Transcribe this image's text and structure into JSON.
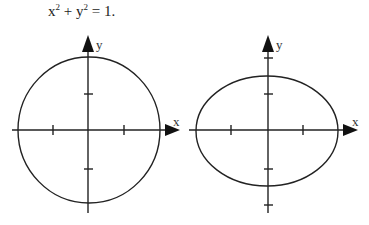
{
  "equation": {
    "var1": "x",
    "exp1": "2",
    "op": " + ",
    "var2": "y",
    "exp2": "2",
    "rhs": " = 1."
  },
  "figures": [
    {
      "name": "circle",
      "x_axis_label": "x",
      "y_axis_label": "y",
      "shape": "circle",
      "center": [
        89,
        130
      ],
      "rx": 71,
      "ry": 73
    },
    {
      "name": "ellipse",
      "x_axis_label": "x",
      "y_axis_label": "y",
      "shape": "ellipse",
      "center": [
        268,
        130
      ],
      "rx": 71,
      "ry": 55
    }
  ],
  "colors": {
    "stroke": "#222222",
    "background": "#ffffff"
  }
}
